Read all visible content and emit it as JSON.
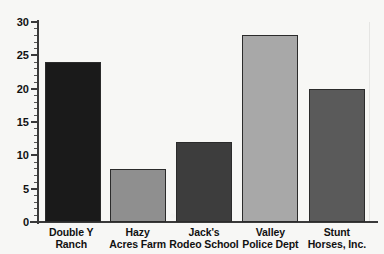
{
  "chart_data": {
    "type": "bar",
    "title": "",
    "subtitle": "",
    "xlabel": "",
    "ylabel": "",
    "categories": [
      "Double Y Ranch",
      "Hazy Acres Farm",
      "Jack's Rodeo School",
      "Valley Police Dept",
      "Stunt Horses, Inc."
    ],
    "category_lines": [
      [
        "Double Y",
        "Ranch"
      ],
      [
        "Hazy",
        "Acres Farm"
      ],
      [
        "Jack's",
        "Rodeo School"
      ],
      [
        "Valley",
        "Police Dept"
      ],
      [
        "Stunt",
        "Horses, Inc."
      ]
    ],
    "values": [
      24,
      8,
      12,
      28,
      20
    ],
    "bar_colors": [
      "#1a1a1a",
      "#8f8f8f",
      "#3d3d3d",
      "#a8a8a8",
      "#5a5a5a"
    ],
    "ylim": [
      0,
      30
    ],
    "y_major_ticks": [
      0,
      5,
      10,
      15,
      20,
      25,
      30
    ],
    "y_tick_labels": [
      "0",
      "5",
      "10",
      "15",
      "20",
      "25",
      "30"
    ],
    "y_minor_tick_interval": 1,
    "grid": false,
    "legend": false,
    "legend_position": "none",
    "background_color": "#f7f7f5",
    "axis_color": "#3a3a3a",
    "text_color": "#111111"
  }
}
